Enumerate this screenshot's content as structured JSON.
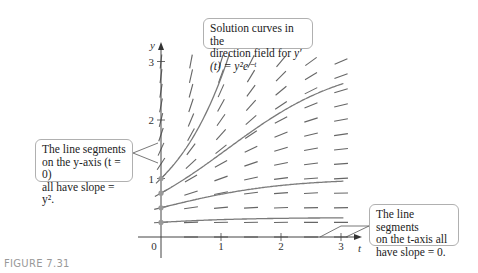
{
  "figure": {
    "label": "FIGURE 7.31"
  },
  "callouts": {
    "title": {
      "line1": "Solution curves in the",
      "line2_prefix": "direction field for ",
      "equation": "y′(t) = y²e⁻ᵗ"
    },
    "y_axis_note": {
      "line1": "The line segments",
      "line2": "on the y-axis (t = 0)",
      "line3": "all have slope = y²."
    },
    "t_axis_note": {
      "line1": "The line segments",
      "line2": "on the t-axis all",
      "line3": "have slope = 0."
    }
  },
  "chart_data": {
    "type": "line",
    "xlabel": "t",
    "ylabel": "y",
    "x_ticks": [
      "0",
      "1",
      "2",
      "3"
    ],
    "y_ticks": [
      "1",
      "2",
      "3"
    ],
    "xlim": [
      0,
      3.2
    ],
    "ylim": [
      0,
      3.2
    ],
    "grid": false,
    "direction_field": {
      "equation": "y' = y^2 e^{-t}",
      "t_values": [
        0,
        0.5,
        1,
        1.5,
        2,
        2.5,
        3
      ],
      "y_values": [
        0,
        0.25,
        0.5,
        0.75,
        1,
        1.25,
        1.5,
        1.75,
        2,
        2.25,
        2.5,
        2.75,
        3
      ]
    },
    "series": [
      {
        "name": "y(0)=1",
        "initial_value": 1.0,
        "x": [
          0,
          0.5,
          1,
          1.5,
          2,
          2.5,
          3
        ],
        "values": [
          1.0,
          1.65,
          2.72,
          4.48,
          7.39,
          12.18,
          20.09
        ]
      },
      {
        "name": "y(0)=0.75",
        "initial_value": 0.75,
        "x": [
          0,
          0.5,
          1,
          1.5,
          2,
          2.5,
          3
        ],
        "values": [
          0.75,
          1.0,
          1.24,
          1.44,
          1.59,
          1.7,
          1.78
        ]
      },
      {
        "name": "y(0)=0.5",
        "initial_value": 0.5,
        "x": [
          0,
          0.5,
          1,
          1.5,
          2,
          2.5,
          3
        ],
        "values": [
          0.5,
          0.62,
          0.73,
          0.82,
          0.88,
          0.92,
          0.95
        ]
      },
      {
        "name": "y(0)=0.25",
        "initial_value": 0.25,
        "x": [
          0,
          0.5,
          1,
          1.5,
          2,
          2.5,
          3
        ],
        "values": [
          0.25,
          0.28,
          0.3,
          0.31,
          0.32,
          0.33,
          0.33
        ]
      }
    ],
    "annotations": [
      "The line segments on the y-axis (t = 0) all have slope = y^2.",
      "The line segments on the t-axis all have slope = 0."
    ]
  }
}
